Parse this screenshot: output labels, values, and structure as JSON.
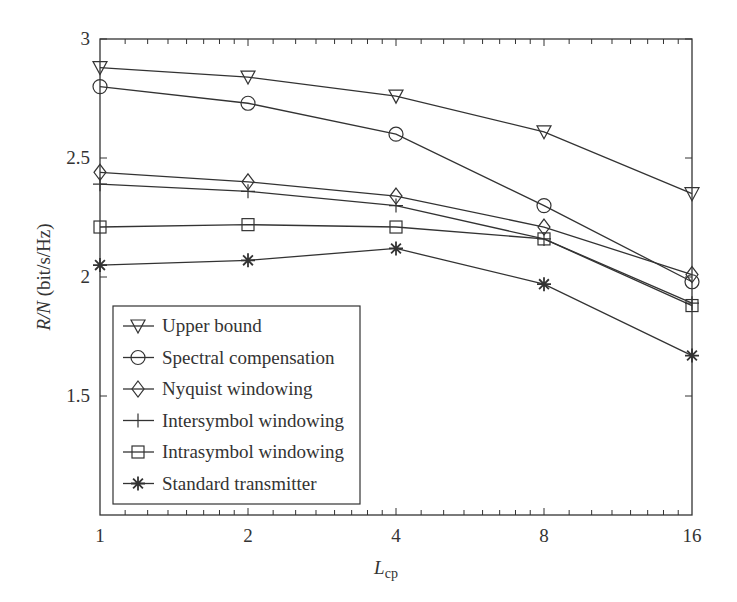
{
  "chart_data": {
    "type": "line",
    "title": "",
    "xlabel": "L_cp",
    "xlabel_main": "L",
    "xlabel_sub": "cp",
    "ylabel": "R/N (bit/s/Hz)",
    "ylabel_italic": "R/N",
    "ylabel_unit": " (bit/s/Hz)",
    "x_scale": "log2",
    "x": [
      1,
      2,
      4,
      8,
      16
    ],
    "x_tick_labels": [
      "1",
      "2",
      "4",
      "8",
      "16"
    ],
    "y_ticks": [
      1.5,
      2,
      2.5,
      3
    ],
    "y_tick_labels": [
      "1.5",
      "2",
      "2.5",
      "3"
    ],
    "xlim": [
      1,
      16
    ],
    "ylim": [
      1,
      3
    ],
    "grid": false,
    "legend_position": "lower left",
    "series": [
      {
        "name": "Upper bound",
        "marker": "triangle-down",
        "values": [
          2.88,
          2.84,
          2.76,
          2.61,
          2.35
        ]
      },
      {
        "name": "Spectral compensation",
        "marker": "circle",
        "values": [
          2.8,
          2.73,
          2.6,
          2.3,
          1.98
        ]
      },
      {
        "name": "Nyquist windowing",
        "marker": "diamond",
        "values": [
          2.44,
          2.4,
          2.34,
          2.21,
          2.01
        ]
      },
      {
        "name": "Intersymbol windowing",
        "marker": "plus",
        "values": [
          2.39,
          2.36,
          2.3,
          2.16,
          1.89
        ]
      },
      {
        "name": "Intrasymbol windowing",
        "marker": "square",
        "values": [
          2.21,
          2.22,
          2.21,
          2.16,
          1.88
        ]
      },
      {
        "name": "Standard transmitter",
        "marker": "star",
        "values": [
          2.05,
          2.07,
          2.12,
          1.97,
          1.67
        ]
      }
    ]
  },
  "colors": {
    "line": "#333333",
    "axis": "#333333",
    "background": "#ffffff"
  }
}
